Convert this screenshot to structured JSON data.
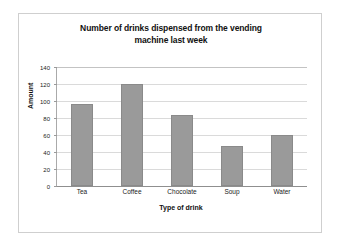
{
  "chart_data": {
    "type": "bar",
    "title": "Number of drinks dispensed from the vending machine last week",
    "title_line1": "Number of drinks dispensed from the vending",
    "title_line2": "machine last week",
    "categories": [
      "Tea",
      "Coffee",
      "Chocolate",
      "Soup",
      "Water"
    ],
    "values": [
      96,
      120,
      84,
      47,
      60
    ],
    "xlabel": "Type of drink",
    "ylabel": "Amount",
    "ylim": [
      0,
      140
    ],
    "ytick_step": 20,
    "yticks": [
      0,
      20,
      40,
      60,
      80,
      100,
      120,
      140
    ],
    "ytick_labels": [
      "0",
      "20",
      "40",
      "60",
      "80",
      "100",
      "120",
      "140"
    ],
    "grid": true,
    "grid_axis": "y",
    "legend": false,
    "bar_color": "#9a9a9a",
    "bar_edge_color": "#8a8a8a",
    "grid_color": "#dadada",
    "axis_color": "#8f8f8f",
    "plot_background": "#ffffff"
  }
}
